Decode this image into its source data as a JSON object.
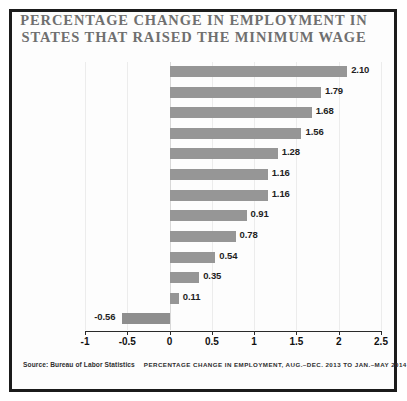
{
  "title": {
    "line1": "PERCENTAGE CHANGE IN EMPLOYMENT IN",
    "line2": "STATES THAT RAISED THE MINIMUM WAGE"
  },
  "ylabel": "13 STATES THAT RAISED THE MINIMUM WAGE IN 2014",
  "footer": {
    "source": "Source: Bureau of Labor Statistics",
    "caption": "PERCENTAGE CHANGE IN EMPLOYMENT, AUG.–DEC. 2013 TO JAN.–MAY 2014"
  },
  "colors": {
    "bar": "#969696",
    "title": "#6f6f6f",
    "frame": "#1b1b1b",
    "grid": "#ececec",
    "axis": "#2a2a2a"
  },
  "chart_data": {
    "type": "bar",
    "orientation": "horizontal",
    "title": "PERCENTAGE CHANGE IN EMPLOYMENT IN STATES THAT RAISED THE MINIMUM WAGE",
    "xlabel": "",
    "ylabel": "13 STATES THAT RAISED THE MINIMUM WAGE IN 2014",
    "categories": [
      "Washington",
      "Colorado",
      "Oregon",
      "Florida",
      "Rhode Island",
      "Missouri",
      "Ohio",
      "Arizona",
      "Montana",
      "New York",
      "Vermont",
      "Connecticut",
      "New Jersey"
    ],
    "values": [
      2.1,
      1.79,
      1.68,
      1.56,
      1.28,
      1.16,
      1.16,
      0.91,
      0.78,
      0.54,
      0.35,
      0.11,
      -0.56
    ],
    "value_labels": [
      "2.10",
      "1.79",
      "1.68",
      "1.56",
      "1.28",
      "1.16",
      "1.16",
      "0.91",
      "0.78",
      "0.54",
      "0.35",
      "0.11",
      "-0.56"
    ],
    "xlim": [
      -1,
      2.5
    ],
    "xticks": [
      -1,
      -0.5,
      0,
      0.5,
      1,
      1.5,
      2,
      2.5
    ],
    "xticklabels": [
      "-1",
      "-0.5",
      "0",
      "0.5",
      "1",
      "1.5",
      "2",
      "2.5"
    ],
    "grid": true,
    "legend": false
  }
}
